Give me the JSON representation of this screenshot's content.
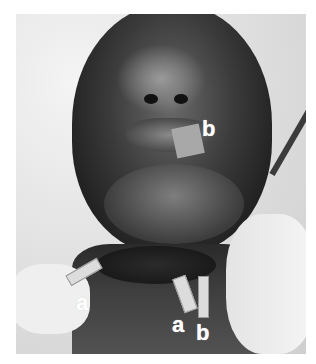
{
  "image": {
    "description": "Grayscale clinical photograph of a supine patient's face and neck with annotated markers",
    "labels": [
      {
        "id": "b-mouth",
        "text": "b"
      },
      {
        "id": "a-left-neck",
        "text": "a"
      },
      {
        "id": "a-right-neck",
        "text": "a"
      },
      {
        "id": "b-right-neck",
        "text": "b"
      }
    ]
  }
}
